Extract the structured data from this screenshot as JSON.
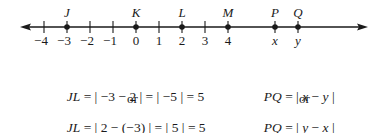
{
  "number_line": {
    "tick_labels": [
      {
        "value": -4,
        "label": "−4",
        "x": 44
      },
      {
        "value": -3,
        "label": "−3",
        "x": 67
      },
      {
        "value": -2,
        "label": "−2",
        "x": 90
      },
      {
        "value": -1,
        "label": "−1",
        "x": 113
      },
      {
        "value": 0,
        "label": "0",
        "x": 136
      },
      {
        "value": 1,
        "label": "1",
        "x": 159
      },
      {
        "value": 2,
        "label": "2",
        "x": 182
      },
      {
        "value": 3,
        "label": "3",
        "x": 205
      },
      {
        "value": 4,
        "label": "4",
        "x": 228
      }
    ],
    "points": [
      {
        "name": "J",
        "at": "−3",
        "x": 67
      },
      {
        "name": "K",
        "at": "0",
        "x": 136
      },
      {
        "name": "L",
        "at": "2",
        "x": 182
      },
      {
        "name": "M",
        "at": "4",
        "x": 228
      },
      {
        "name": "P",
        "at": "x",
        "x": 275
      },
      {
        "name": "Q",
        "at": "y",
        "x": 298
      }
    ],
    "variable_labels": [
      {
        "label": "x",
        "x": 275
      },
      {
        "label": "y",
        "x": 298
      }
    ]
  },
  "equations": {
    "left": {
      "line1_lhs": "JL",
      "line1_rhs": " = | −3 − 2 | = | −5 | = 5",
      "or": "or",
      "line2_lhs": "JL",
      "line2_rhs": " = | 2 − (−3) | = | 5 | = 5"
    },
    "right": {
      "line1_lhs": "PQ",
      "line1_mid": " = | ",
      "line1_a": "x",
      "line1_op": " − ",
      "line1_b": "y",
      "line1_end": " |",
      "or": "or",
      "line2_lhs": "PQ",
      "line2_mid": " = | ",
      "line2_a": "y",
      "line2_op": " − ",
      "line2_b": "x",
      "line2_end": " |"
    }
  }
}
